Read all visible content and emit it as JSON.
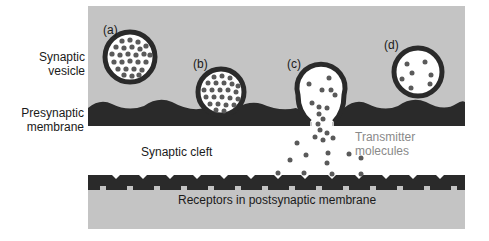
{
  "diagram": {
    "colors": {
      "cytoplasm": "#c4c4c4",
      "membrane": "#2a2a2a",
      "vesicle_interior": "#ffffff",
      "transmitter": "#5a5a5a",
      "cleft": "#ffffff"
    },
    "labels": {
      "synaptic_vesicle": [
        "Synaptic",
        "vesicle"
      ],
      "presynaptic_membrane": [
        "Presynaptic",
        "membrane"
      ],
      "synaptic_cleft": "Synaptic cleft",
      "transmitter_molecules": [
        "Transmitter",
        "molecules"
      ],
      "receptors": "Receptors in postsynaptic membrane"
    },
    "vesicles": [
      {
        "id": "a",
        "label": "(a)",
        "cx": 130,
        "cy": 57,
        "r": 27,
        "molecules": 40,
        "stage": "free, full"
      },
      {
        "id": "b",
        "label": "(b)",
        "cx": 221,
        "cy": 92,
        "r": 25,
        "molecules": 38,
        "stage": "docked at membrane"
      },
      {
        "id": "c",
        "label": "(c)",
        "cx": 321,
        "cy": 92,
        "r": 25,
        "molecules": 9,
        "stage": "fused, releasing transmitter"
      },
      {
        "id": "d",
        "label": "(d)",
        "cx": 418,
        "cy": 72,
        "r": 26,
        "molecules": 7,
        "stage": "recycled, mostly empty"
      }
    ]
  }
}
